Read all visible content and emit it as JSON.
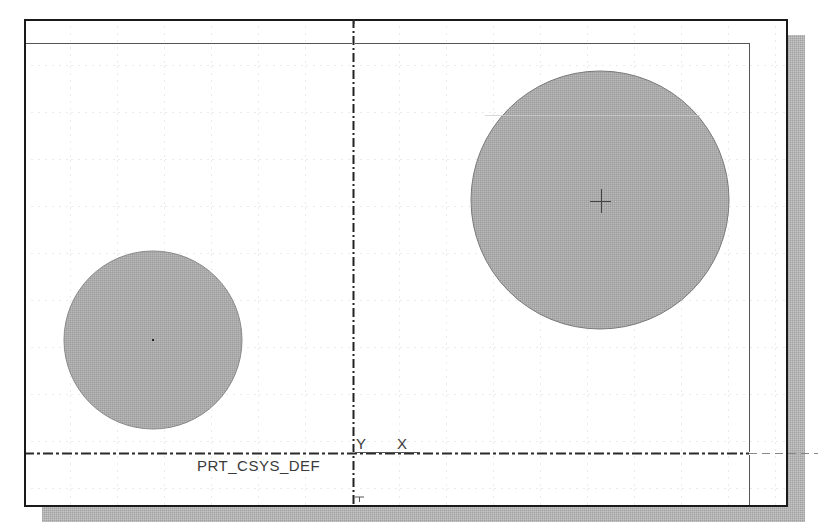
{
  "viewport": {
    "title": "Sketch graphics window",
    "background": "#ffffff",
    "frame_color": "#1a1a1a",
    "shadow_color": "#b0b0b0",
    "grid_color": "#d8d8d8",
    "fill_color": "#a9a9a9",
    "outline_color": "#7a7a7a"
  },
  "coordinate_system": {
    "name": "PRT_CSYS_DEF",
    "x_label": "X",
    "y_label": "Y",
    "origin": [
      353,
      453
    ]
  },
  "sketch": {
    "circles": [
      {
        "name": "small-circle",
        "cx": 153,
        "cy": 340,
        "r": 89,
        "center_mark": "dot"
      },
      {
        "name": "large-circle",
        "cx": 600,
        "cy": 200,
        "r": 129,
        "center_mark": "cross"
      }
    ],
    "boundary": {
      "top_line_y": 43,
      "right_line_x": 749
    }
  },
  "top_fragment": "'"
}
